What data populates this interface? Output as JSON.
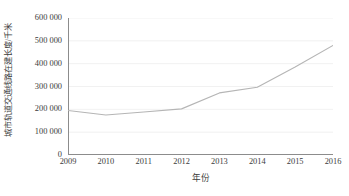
{
  "chart_data": {
    "type": "line",
    "title": "",
    "subtitle": "",
    "xlabel": "年份",
    "ylabel": "城市轨道交通线路在建长度/千米",
    "categories": [
      "2009",
      "2010",
      "2011",
      "2012",
      "2013",
      "2014",
      "2015",
      "2016"
    ],
    "x": [
      2009,
      2010,
      2011,
      2012,
      2013,
      2014,
      2015,
      2016
    ],
    "series": [
      {
        "name": "城市轨道交通线路在建长度",
        "values": [
          195000,
          175000,
          188000,
          202000,
          272000,
          297000,
          385000,
          480000
        ],
        "color": "#b5b5b5"
      }
    ],
    "values": [
      195000,
      175000,
      188000,
      202000,
      272000,
      297000,
      385000,
      480000
    ],
    "ylim": [
      0,
      600000
    ],
    "xlim": [
      2009,
      2016
    ],
    "ytick_labels": [
      "0",
      "100 000",
      "200 000",
      "300 000",
      "400 000",
      "500 000",
      "600 000"
    ],
    "ytick_values": [
      0,
      100000,
      200000,
      300000,
      400000,
      500000,
      600000
    ],
    "xtick_labels": [
      "2009",
      "2010",
      "2011",
      "2012",
      "2013",
      "2014",
      "2015",
      "2016"
    ],
    "grid": true,
    "grid_color": "#ededed",
    "legend": false,
    "legend_position": "none",
    "axis_color": "#8c8c8c",
    "tick_direction": "out",
    "markers": false,
    "annotations": []
  }
}
